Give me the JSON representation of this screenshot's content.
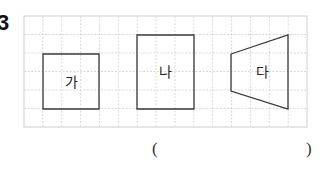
{
  "question": {
    "number": "3"
  },
  "grid": {
    "left": 24,
    "top": 16,
    "cell": 18.87,
    "cols": 15,
    "rows": 6,
    "border_color": "#d0d0d0",
    "line_color": "#cfcfcf"
  },
  "shapes": [
    {
      "label": "가",
      "type": "square",
      "points": [
        [
          43,
          54
        ],
        [
          99,
          54
        ],
        [
          99,
          109
        ],
        [
          43,
          109
        ]
      ],
      "label_pos": [
        71,
        87
      ]
    },
    {
      "label": "나",
      "type": "rectangle",
      "points": [
        [
          137,
          35
        ],
        [
          194,
          35
        ],
        [
          194,
          109
        ],
        [
          137,
          109
        ]
      ],
      "label_pos": [
        165,
        77
      ]
    },
    {
      "label": "다",
      "type": "trapezoid",
      "points": [
        [
          231,
          54
        ],
        [
          288,
          35
        ],
        [
          288,
          109
        ],
        [
          231,
          91
        ]
      ],
      "label_pos": [
        262,
        77
      ]
    }
  ],
  "shape_stroke": "#3a3a3a",
  "answer": {
    "open": "(",
    "close": ")"
  }
}
